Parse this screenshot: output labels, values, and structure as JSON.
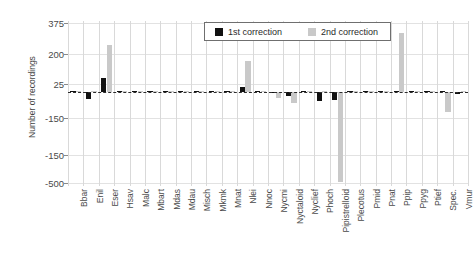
{
  "chart_data": {
    "type": "bar",
    "title": "",
    "xlabel": "",
    "ylabel": "Number of recordings",
    "ylim": [
      -500,
      375
    ],
    "yticks": [
      375,
      200,
      25,
      -150,
      -150,
      -500
    ],
    "ytick_labels": [
      "375",
      "200",
      "25",
      "-150",
      "-150",
      "-500"
    ],
    "grid": true,
    "legend_position": "top-right-inside",
    "categories": [
      "Bbar",
      "Enil",
      "Eser",
      "Hsav",
      "Malc",
      "Mbart",
      "Mdas",
      "Mdau",
      "Misch",
      "Mkmk",
      "Mnat",
      "Nlei",
      "Nnoc",
      "Nycmi",
      "Nyctaloid",
      "Nyclief",
      "Phoch",
      "Pipistrelloid",
      "Plecotus",
      "Pmid",
      "Pnat",
      "Ppip",
      "Ppyg",
      "Ptief",
      "Spec.",
      "Vmur"
    ],
    "series": [
      {
        "name": "1st correction",
        "color": "#111111",
        "values": [
          2,
          -38,
          72,
          0,
          1,
          1,
          2,
          2,
          2,
          1,
          1,
          24,
          0,
          -10,
          -26,
          0,
          -52,
          -48,
          2,
          3,
          2,
          1,
          0,
          0,
          1,
          -14
        ]
      },
      {
        "name": "2nd correction",
        "color": "#c9c9c9",
        "values": [
          0,
          0,
          252,
          1,
          0,
          0,
          0,
          0,
          0,
          0,
          0,
          166,
          0,
          -34,
          -60,
          0,
          0,
          -496,
          0,
          0,
          0,
          320,
          0,
          0,
          -110,
          0
        ]
      }
    ]
  },
  "legend": {
    "items": [
      {
        "label": "1st correction",
        "swatch": "black-square-icon"
      },
      {
        "label": "2nd correction",
        "swatch": "gray-square-icon"
      }
    ]
  }
}
